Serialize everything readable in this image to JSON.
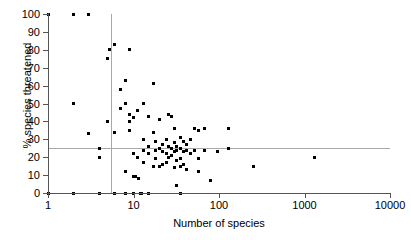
{
  "chart_data": {
    "type": "scatter",
    "title": "",
    "xlabel": "Number of species",
    "ylabel": "% species threatened",
    "xscale": "log",
    "yscale": "linear",
    "xlim": [
      1,
      10000
    ],
    "ylim": [
      0,
      100
    ],
    "grid": false,
    "legend": null,
    "xticks": [
      1,
      10,
      100,
      1000,
      10000
    ],
    "xtick_labels": [
      "1",
      "10",
      "100",
      "1000",
      "10000"
    ],
    "yticks": [
      0,
      10,
      20,
      30,
      40,
      50,
      60,
      70,
      80,
      90,
      100
    ],
    "ytick_labels": [
      "0",
      "10",
      "20",
      "30",
      "40",
      "50",
      "60",
      "70",
      "80",
      "90",
      "100"
    ],
    "reference_lines": [
      {
        "orientation": "horizontal",
        "value": 25,
        "color": "#a8a8a8"
      },
      {
        "orientation": "vertical",
        "value": 5.5,
        "color": "#a8a8a8"
      }
    ],
    "marker": {
      "shape": "square",
      "color": "#000000",
      "size": 3
    },
    "points": [
      [
        1,
        100
      ],
      [
        2,
        100
      ],
      [
        3,
        100
      ],
      [
        1,
        0
      ],
      [
        2,
        50
      ],
      [
        2,
        0
      ],
      [
        3,
        33
      ],
      [
        4,
        25
      ],
      [
        4,
        20
      ],
      [
        4,
        0
      ],
      [
        5,
        75
      ],
      [
        5,
        40
      ],
      [
        5.2,
        80
      ],
      [
        6,
        83
      ],
      [
        6,
        34
      ],
      [
        6,
        0
      ],
      [
        7,
        58
      ],
      [
        7,
        47
      ],
      [
        8,
        63
      ],
      [
        8,
        50
      ],
      [
        8,
        12
      ],
      [
        8,
        0
      ],
      [
        9,
        80
      ],
      [
        9,
        40
      ],
      [
        9,
        44
      ],
      [
        9,
        35
      ],
      [
        10,
        42
      ],
      [
        10,
        22
      ],
      [
        10,
        9
      ],
      [
        10.5,
        9
      ],
      [
        10,
        0
      ],
      [
        11,
        46
      ],
      [
        11,
        20
      ],
      [
        11.5,
        8
      ],
      [
        12,
        0
      ],
      [
        12.5,
        0
      ],
      [
        13,
        50
      ],
      [
        13,
        30
      ],
      [
        13,
        24
      ],
      [
        13,
        17
      ],
      [
        15,
        43
      ],
      [
        15,
        26
      ],
      [
        15,
        22
      ],
      [
        15,
        0
      ],
      [
        17,
        61
      ],
      [
        17,
        34
      ],
      [
        17,
        15
      ],
      [
        18,
        29
      ],
      [
        18,
        24
      ],
      [
        18,
        19
      ],
      [
        20,
        41
      ],
      [
        20,
        25
      ],
      [
        20,
        15
      ],
      [
        22,
        27
      ],
      [
        22,
        23
      ],
      [
        22,
        16
      ],
      [
        24,
        30
      ],
      [
        24,
        22
      ],
      [
        24,
        17
      ],
      [
        26,
        44
      ],
      [
        26,
        26
      ],
      [
        26,
        20
      ],
      [
        28,
        43
      ],
      [
        28,
        25
      ],
      [
        28,
        21
      ],
      [
        30,
        36
      ],
      [
        30,
        28
      ],
      [
        30,
        23
      ],
      [
        30,
        14
      ],
      [
        32,
        26
      ],
      [
        32,
        24
      ],
      [
        32,
        18
      ],
      [
        32,
        4
      ],
      [
        35,
        31
      ],
      [
        35,
        25
      ],
      [
        35,
        19
      ],
      [
        35,
        15
      ],
      [
        35,
        0
      ],
      [
        38,
        29
      ],
      [
        38,
        23
      ],
      [
        38,
        16
      ],
      [
        42,
        27
      ],
      [
        42,
        24
      ],
      [
        42,
        13
      ],
      [
        46,
        30
      ],
      [
        46,
        22
      ],
      [
        52,
        36
      ],
      [
        52,
        24
      ],
      [
        58,
        35
      ],
      [
        58,
        19
      ],
      [
        58,
        12
      ],
      [
        68,
        36
      ],
      [
        68,
        24
      ],
      [
        80,
        7
      ],
      [
        95,
        23
      ],
      [
        130,
        36
      ],
      [
        130,
        25
      ],
      [
        250,
        15
      ],
      [
        1300,
        20
      ]
    ]
  },
  "axis": {
    "y_title": "% species threatened",
    "x_title": "Number of species"
  }
}
